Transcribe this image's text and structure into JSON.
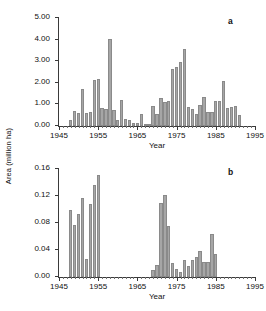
{
  "figure": {
    "y_axis_title": "Area (million ha)",
    "background": "#ffffff",
    "bar_fill": "#a6a6a6",
    "bar_stroke": "#8a8a8a",
    "axis_color": "#3a3a3a"
  },
  "chart_data": [
    {
      "type": "bar",
      "panel_label": "a",
      "title": "",
      "xlabel": "Year",
      "ylabel": "Area (million ha)",
      "xlim": [
        1945,
        1995
      ],
      "ylim": [
        0.0,
        5.0
      ],
      "ytick_labels": [
        "0.00",
        "1.00",
        "2.00",
        "3.00",
        "4.00",
        "5.00"
      ],
      "ytick_values": [
        0.0,
        1.0,
        2.0,
        3.0,
        4.0,
        5.0
      ],
      "xtick_labels": [
        "1945",
        "1955",
        "1965",
        "1975",
        "1985",
        "1995"
      ],
      "xtick_values": [
        1945,
        1955,
        1965,
        1975,
        1985,
        1995
      ],
      "xtick_minor_step": 1,
      "grid": false,
      "legend": "none",
      "x": [
        1948,
        1949,
        1950,
        1951,
        1952,
        1953,
        1954,
        1955,
        1956,
        1957,
        1958,
        1959,
        1960,
        1961,
        1962,
        1963,
        1964,
        1965,
        1966,
        1967,
        1968,
        1969,
        1970,
        1971,
        1972,
        1973,
        1974,
        1975,
        1976,
        1977,
        1978,
        1979,
        1980,
        1981,
        1982,
        1983,
        1984,
        1985,
        1986,
        1987,
        1988,
        1989,
        1990,
        1991
      ],
      "values": [
        0.3,
        0.7,
        0.62,
        1.72,
        0.6,
        0.63,
        2.13,
        2.18,
        0.82,
        0.8,
        4.05,
        0.76,
        0.3,
        1.22,
        0.33,
        0.3,
        0.13,
        0.12,
        0.55,
        0.08,
        0.06,
        0.94,
        0.57,
        1.3,
        1.12,
        1.15,
        2.62,
        2.72,
        2.95,
        3.58,
        0.88,
        0.8,
        0.57,
        0.95,
        1.34,
        0.67,
        0.64,
        1.18,
        1.16,
        2.08,
        0.83,
        0.86,
        0.92,
        0.5
      ]
    },
    {
      "type": "bar",
      "panel_label": "b",
      "title": "",
      "xlabel": "Year",
      "ylabel": "Area (million ha)",
      "xlim": [
        1945,
        1995
      ],
      "ylim": [
        0.0,
        0.16
      ],
      "ytick_labels": [
        "0.00",
        "0.04",
        "0.08",
        "0.12",
        "0.16"
      ],
      "ytick_values": [
        0.0,
        0.04,
        0.08,
        0.12,
        0.16
      ],
      "xtick_labels": [
        "1945",
        "1955",
        "1965",
        "1975",
        "1985",
        "1995"
      ],
      "xtick_values": [
        1945,
        1955,
        1965,
        1975,
        1985,
        1995
      ],
      "xtick_minor_step": 1,
      "grid": false,
      "legend": "none",
      "x": [
        1948,
        1949,
        1950,
        1951,
        1952,
        1953,
        1954,
        1955,
        1969,
        1970,
        1971,
        1972,
        1973,
        1974,
        1975,
        1976,
        1977,
        1978,
        1979,
        1980,
        1981,
        1982,
        1983,
        1984,
        1985
      ],
      "values": [
        0.099,
        0.077,
        0.093,
        0.117,
        0.026,
        0.108,
        0.137,
        0.151,
        0.01,
        0.018,
        0.109,
        0.122,
        0.075,
        0.021,
        0.012,
        0.008,
        0.025,
        0.017,
        0.025,
        0.03,
        0.038,
        0.022,
        0.022,
        0.063,
        0.034
      ]
    }
  ]
}
